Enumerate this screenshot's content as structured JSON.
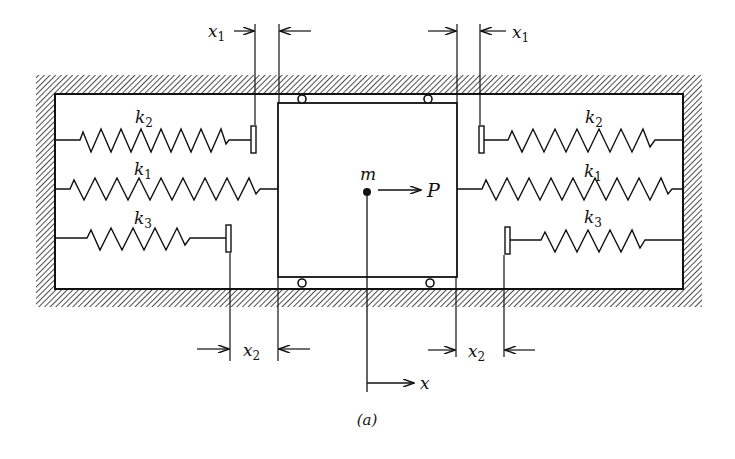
{
  "figure": {
    "caption": "(a)",
    "mass_label": "m",
    "force_label": "P",
    "displacement_label": "x"
  },
  "springs": [
    {
      "id": "k2-left",
      "symbol": "k",
      "subscript": "2",
      "side": "left",
      "attached_to": "stopper"
    },
    {
      "id": "k1-left",
      "symbol": "k",
      "subscript": "1",
      "side": "left",
      "attached_to": "mass"
    },
    {
      "id": "k3-left",
      "symbol": "k",
      "subscript": "3",
      "side": "left",
      "attached_to": "stopper"
    },
    {
      "id": "k2-right",
      "symbol": "k",
      "subscript": "2",
      "side": "right",
      "attached_to": "stopper"
    },
    {
      "id": "k1-right",
      "symbol": "k",
      "subscript": "1",
      "side": "right",
      "attached_to": "mass"
    },
    {
      "id": "k3-right",
      "symbol": "k",
      "subscript": "3",
      "side": "right",
      "attached_to": "stopper"
    }
  ],
  "gaps": [
    {
      "id": "gap-top-left",
      "symbol": "x",
      "subscript": "1"
    },
    {
      "id": "gap-top-right",
      "symbol": "x",
      "subscript": "1"
    },
    {
      "id": "gap-bottom-left",
      "symbol": "x",
      "subscript": "2"
    },
    {
      "id": "gap-bottom-right",
      "symbol": "x",
      "subscript": "2"
    }
  ],
  "colors": {
    "ink": "#111111",
    "background": "#ffffff"
  }
}
